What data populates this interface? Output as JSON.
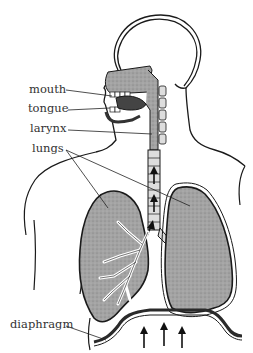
{
  "diagram": {
    "labels": [
      {
        "id": "mouth",
        "text": "mouth",
        "x": 29,
        "y": 85
      },
      {
        "id": "tongue",
        "text": "tongue",
        "x": 28,
        "y": 104
      },
      {
        "id": "larynx",
        "text": "larynx",
        "x": 30,
        "y": 124
      },
      {
        "id": "lungs",
        "text": "lungs",
        "x": 32,
        "y": 145
      },
      {
        "id": "diaphragm",
        "text": "diaphragm",
        "x": 10,
        "y": 321
      }
    ],
    "arrows": {
      "count_trachea": 3,
      "count_diaphragm": 3,
      "direction": "up"
    },
    "colors": {
      "line": "#1a1a1a",
      "tissue": "#9a9a9a",
      "tissue_dark": "#555555",
      "background": "#ffffff"
    }
  }
}
